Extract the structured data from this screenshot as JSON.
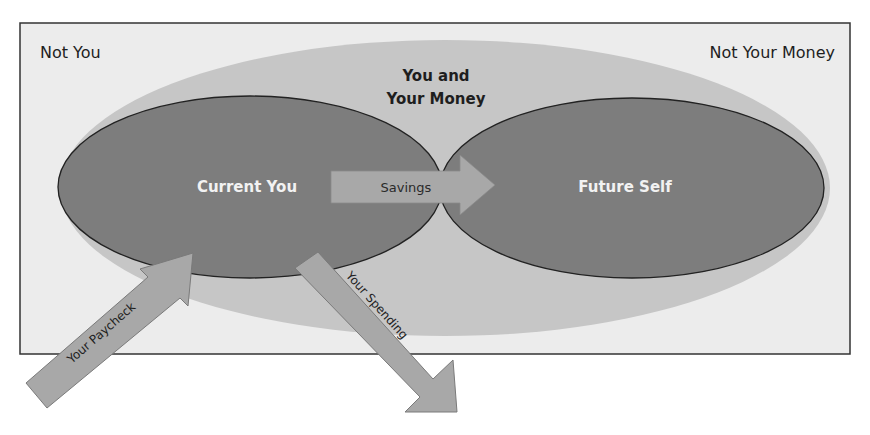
{
  "diagram": {
    "corner_labels": {
      "top_left": "Not You",
      "top_right": "Not Your Money"
    },
    "outer_region": {
      "line1": "You and",
      "line2": "Your Money"
    },
    "nodes": {
      "current": "Current You",
      "future": "Future Self"
    },
    "arrows": {
      "savings": "Savings",
      "paycheck": "Your Paycheck",
      "spending": "Your Spending"
    },
    "colors": {
      "frame_bg": "#ececec",
      "outer_ellipse": "#c4c4c4",
      "inner_ellipse": "#7c7c7c",
      "arrow_fill": "#a7a7a7",
      "white_text": "#f2f2f2",
      "dark_text": "#1e1e1e"
    }
  }
}
